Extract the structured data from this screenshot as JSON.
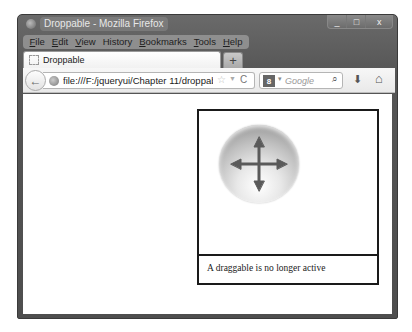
{
  "window": {
    "title": "Droppable - Mozilla Firefox",
    "controls": {
      "minimize": "_",
      "maximize": "□",
      "close": "x"
    }
  },
  "menubar": {
    "items": [
      {
        "label": "File",
        "accel": "F",
        "rest": "ile"
      },
      {
        "label": "Edit",
        "accel": "E",
        "rest": "dit"
      },
      {
        "label": "View",
        "accel": "V",
        "rest": "iew"
      },
      {
        "label": "History",
        "accel": "",
        "rest": "History"
      },
      {
        "label": "Bookmarks",
        "accel": "B",
        "rest": "ookmarks"
      },
      {
        "label": "Tools",
        "accel": "T",
        "rest": "ools"
      },
      {
        "label": "Help",
        "accel": "H",
        "rest": "elp"
      }
    ]
  },
  "tabs": [
    {
      "label": "Droppable",
      "active": true
    }
  ],
  "new_tab_label": "+",
  "navbar": {
    "back_icon": "←",
    "url": "file:///F:/jqueryui/Chapter 11/droppab",
    "bookmark_icon": "☆",
    "dropdown_icon": "▼",
    "reload_icon": "C",
    "search": {
      "engine_icon": "8",
      "engine_dropdown": "▾",
      "placeholder": "Google",
      "search_icon": "⌕"
    },
    "download_icon": "⬇",
    "home_icon": "⌂"
  },
  "page": {
    "droppable": {
      "status_text": "A draggable is no longer active"
    },
    "draggable": {
      "icon": "move-arrows"
    }
  }
}
